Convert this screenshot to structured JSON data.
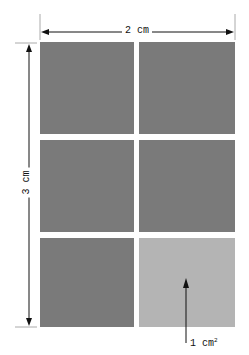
{
  "diagram": {
    "width_label": "2 cm",
    "height_label": "3 cm",
    "unit_label": "1 cm",
    "unit_superscript": "2",
    "grid": {
      "columns": 2,
      "rows": 3,
      "highlighted_cell": {
        "row": 3,
        "column": 2
      }
    },
    "colors": {
      "cell": "#7a7a7a",
      "highlighted_cell": "#b4b4b4",
      "lines": "#111111"
    }
  }
}
